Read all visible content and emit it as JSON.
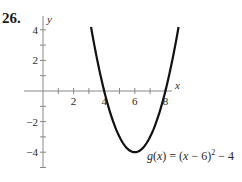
{
  "problem": {
    "number": "26."
  },
  "chart_data": {
    "type": "line",
    "title": "",
    "function_label": "g(x) = (x − 6)² − 4",
    "function_label_parts": {
      "g": "g",
      "open": "(",
      "x": "x",
      "rest": ") = (",
      "x2": "x",
      "minus6": " − 6)",
      "exp": "2",
      "tail": " − 4"
    },
    "xlabel": "x",
    "ylabel": "y",
    "xlim": [
      0,
      8.5
    ],
    "ylim": [
      -5,
      5
    ],
    "x_ticks": [
      1,
      2,
      3,
      4,
      5,
      6,
      7,
      8
    ],
    "x_tick_labels": [
      "2",
      "4",
      "6",
      "8"
    ],
    "x_tick_label_values": [
      2,
      4,
      6,
      8
    ],
    "y_ticks": [
      -5,
      -4,
      -3,
      -2,
      -1,
      1,
      2,
      3,
      4
    ],
    "y_tick_labels": [
      "4",
      "2",
      "−2",
      "−4"
    ],
    "y_tick_label_values": [
      4,
      2,
      -2,
      -4
    ],
    "grid": false,
    "series": [
      {
        "name": "g(x)",
        "expression": "(x-6)^2-4",
        "vertex": [
          6,
          -4
        ],
        "x_intercepts": [
          4,
          8
        ],
        "domain": [
          3.14,
          8.86
        ],
        "color": "#111111"
      }
    ]
  }
}
